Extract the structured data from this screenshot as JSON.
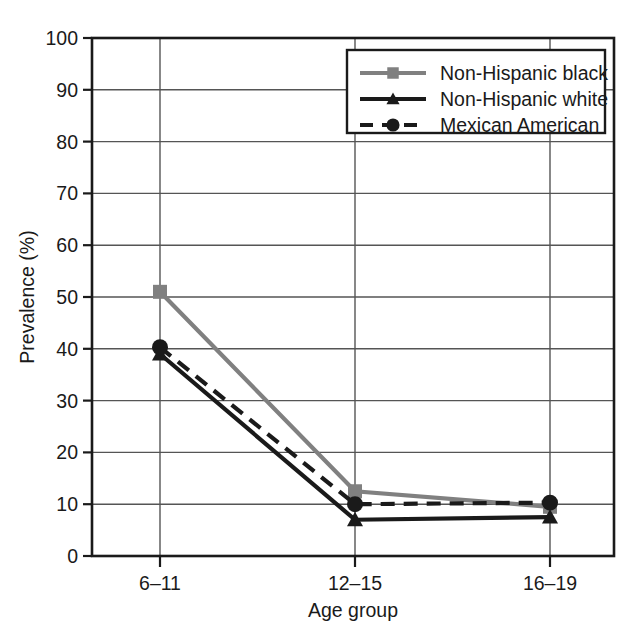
{
  "chart_data": {
    "type": "line",
    "title": "",
    "subtitle": "",
    "xlabel": "Age group",
    "ylabel": "Prevalence (%)",
    "categories": [
      "6–11",
      "12–15",
      "16–19"
    ],
    "ylim": [
      0,
      100
    ],
    "ytick_labels": [
      "0",
      "10",
      "20",
      "30",
      "40",
      "50",
      "60",
      "70",
      "80",
      "90",
      "100"
    ],
    "ytick_values": [
      0,
      10,
      20,
      30,
      40,
      50,
      60,
      70,
      80,
      90,
      100
    ],
    "grid": "horizontal-and-category-verticals",
    "legend_position": "top-right-inside",
    "series": [
      {
        "name": "Non-Hispanic black",
        "values": [
          51.0,
          12.5,
          9.5
        ],
        "color": "#808080",
        "marker": "square",
        "line_style": "solid"
      },
      {
        "name": "Non-Hispanic white",
        "values": [
          39.0,
          7.0,
          7.5
        ],
        "color": "#1a1a1a",
        "marker": "triangle",
        "line_style": "solid"
      },
      {
        "name": "Mexican American",
        "values": [
          40.3,
          10.0,
          10.3
        ],
        "color": "#1a1a1a",
        "marker": "circle",
        "line_style": "dashed"
      }
    ]
  },
  "axes": {
    "y_title": "Prevalence (%)",
    "x_title": "Age group"
  },
  "legend": {
    "items": [
      {
        "label": "Non-Hispanic black"
      },
      {
        "label": "Non-Hispanic white"
      },
      {
        "label": "Mexican American"
      }
    ]
  },
  "colors": {
    "series_gray": "#808080",
    "series_black": "#1a1a1a",
    "grid": "#555555",
    "frame": "#1a1a1a",
    "background": "#ffffff"
  }
}
